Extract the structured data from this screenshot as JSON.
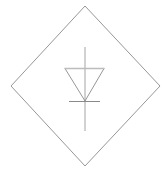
{
  "canvas": {
    "width": 167,
    "height": 172,
    "background_color": "#ffffff",
    "title": "Diode symbol in diamond outline"
  },
  "diagram": {
    "type": "electrical-schematic-symbol",
    "component_name": "diode",
    "enclosure_shape": "diamond",
    "colors": {
      "outline": "#8a8a8a",
      "symbol_stroke": "#8a8a8a",
      "symbol_top_bar": "#bcbcbc",
      "lead": "#9a9a9a",
      "cathode_bar": "#8a8a8a"
    },
    "stroke_widths": {
      "outline": 0.9,
      "triangle_side": 0.9,
      "top_bar": 1.6,
      "lead": 0.9,
      "cathode_bar": 1.0
    },
    "diamond": {
      "top": {
        "x": 85,
        "y": 6
      },
      "right": {
        "x": 160,
        "y": 86
      },
      "bottom": {
        "x": 85,
        "y": 166
      },
      "left": {
        "x": 11,
        "y": 86
      },
      "points": "85,6 160,86 85,166 11,86"
    },
    "triangle": {
      "top_left": {
        "x": 65,
        "y": 68.5
      },
      "top_right": {
        "x": 104,
        "y": 68.5
      },
      "apex": {
        "x": 85,
        "y": 101
      },
      "points": "65,68.5 104,68.5 85,101"
    },
    "lead_line": {
      "x": 85,
      "y_top": 47,
      "y_bottom": 131
    },
    "cathode_bar": {
      "y": 101.5,
      "x_start": 69,
      "x_end": 100
    }
  }
}
